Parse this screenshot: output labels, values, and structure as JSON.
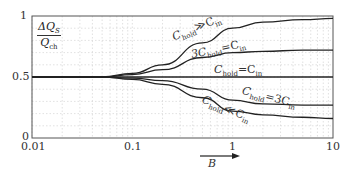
{
  "chart_data": {
    "type": "line",
    "title": "",
    "xlabel": "B",
    "ylabel": "ΔQ_S / Q_ch",
    "xscale": "log",
    "xlim": [
      0.01,
      10
    ],
    "ylim": [
      0,
      1
    ],
    "x_ticks": [
      "0.01",
      "0.1",
      "1",
      "10"
    ],
    "y_ticks": [
      "0",
      "0.5",
      "1"
    ],
    "grid": true,
    "series": [
      {
        "name": "C_hold ≫ C_in",
        "x": [
          0.01,
          0.05,
          0.1,
          0.2,
          0.5,
          1,
          2,
          5,
          10
        ],
        "values": [
          0.5,
          0.5,
          0.53,
          0.6,
          0.78,
          0.9,
          0.95,
          0.97,
          0.98
        ]
      },
      {
        "name": "3C_hold = C_in",
        "x": [
          0.01,
          0.05,
          0.1,
          0.2,
          0.5,
          1,
          2,
          5,
          10
        ],
        "values": [
          0.5,
          0.5,
          0.52,
          0.56,
          0.66,
          0.7,
          0.71,
          0.72,
          0.72
        ]
      },
      {
        "name": "C_hold = C_in",
        "x": [
          0.01,
          10
        ],
        "values": [
          0.5,
          0.5
        ]
      },
      {
        "name": "C_hold = 3C_in",
        "x": [
          0.01,
          0.05,
          0.1,
          0.2,
          0.5,
          1,
          2,
          5,
          10
        ],
        "values": [
          0.5,
          0.5,
          0.49,
          0.47,
          0.4,
          0.31,
          0.28,
          0.27,
          0.27
        ]
      },
      {
        "name": "C_hold ≪ C_in",
        "x": [
          0.01,
          0.05,
          0.1,
          0.2,
          0.5,
          1,
          2,
          5,
          10
        ],
        "values": [
          0.5,
          0.5,
          0.48,
          0.44,
          0.33,
          0.22,
          0.19,
          0.17,
          0.16
        ]
      }
    ]
  },
  "labels": {
    "ylabel_num": "ΔQ",
    "ylabel_num_sub": "S",
    "ylabel_den": "Q",
    "ylabel_den_sub": "ch",
    "xlabel": "B",
    "y1": "1",
    "y05": "0.5",
    "y0": "0",
    "x001": "0.01",
    "x01": "0.1",
    "x1": "1",
    "x10": "10",
    "s1": "C",
    "s1_sub": "hold",
    "s1_rest": "≫C",
    "s1_sub2": "in",
    "s2": "3C",
    "s2_sub": "hold",
    "s2_rest": "=C",
    "s2_sub2": "in",
    "s3": "C",
    "s3_sub": "hold",
    "s3_rest": "=C",
    "s3_sub2": "in",
    "s4": "C",
    "s4_sub": "hold",
    "s4_rest": "=3C",
    "s4_sub2": "in",
    "s5": "C",
    "s5_sub": "hold",
    "s5_rest": "≪C",
    "s5_sub2": "in"
  }
}
